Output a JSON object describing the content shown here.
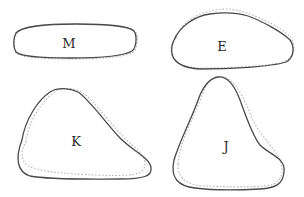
{
  "diagram": {
    "colors": {
      "solid_outline": "#4a4a4a",
      "dotted_outline": "#b5b5b5",
      "label": "#2a2a2a",
      "background": "#ffffff"
    },
    "shapes": [
      {
        "id": "M",
        "label": "M",
        "position": "top-left",
        "form": "elongated flat oval"
      },
      {
        "id": "E",
        "label": "E",
        "position": "top-right",
        "form": "rounded teardrop tapering to the right"
      },
      {
        "id": "K",
        "label": "K",
        "position": "bottom-left",
        "form": "rounded triangle with peak upper-left"
      },
      {
        "id": "J",
        "label": "J",
        "position": "bottom-right",
        "form": "tall rounded triangle with peak at top"
      }
    ]
  }
}
